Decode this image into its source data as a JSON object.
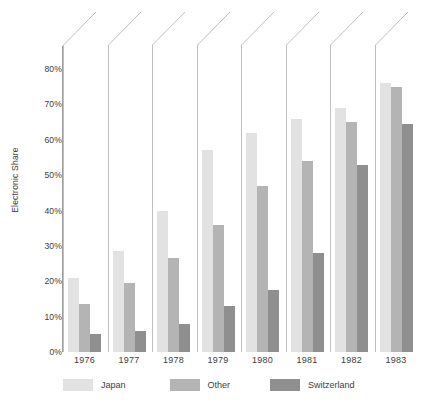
{
  "chart_data": {
    "type": "bar",
    "title": "",
    "subtitle": "",
    "xlabel": "",
    "ylabel": "Electronic Share",
    "categories": [
      "1976",
      "1977",
      "1978",
      "1979",
      "1980",
      "1981",
      "1982",
      "1983"
    ],
    "series": [
      {
        "name": "Japan",
        "color": "#e2e2e2",
        "values": [
          21,
          28.5,
          40,
          57,
          62,
          66,
          69,
          76
        ]
      },
      {
        "name": "Other",
        "color": "#b4b4b4",
        "values": [
          13.5,
          19.5,
          26.5,
          36,
          47,
          54,
          65,
          75
        ]
      },
      {
        "name": "Switzerland",
        "color": "#8f8f8f",
        "values": [
          5,
          6,
          8,
          13,
          17.5,
          28,
          53,
          64.5
        ]
      }
    ],
    "ylim": [
      0,
      85
    ],
    "y_ticks": [
      0,
      10,
      20,
      30,
      40,
      50,
      60,
      70,
      80
    ],
    "y_tick_labels": [
      "0%",
      "10%",
      "20%",
      "30%",
      "40%",
      "50%",
      "60%",
      "70%",
      "80%"
    ],
    "grid": false,
    "legend_position": "bottom-left",
    "legend_entries": [
      "Japan",
      "Other",
      "Switzerland"
    ],
    "annotations": "Each year group is preceded by a vertical separator line that bends into an upward diagonal above the plot area."
  },
  "axis": {
    "y_title": "Electronic Share"
  }
}
